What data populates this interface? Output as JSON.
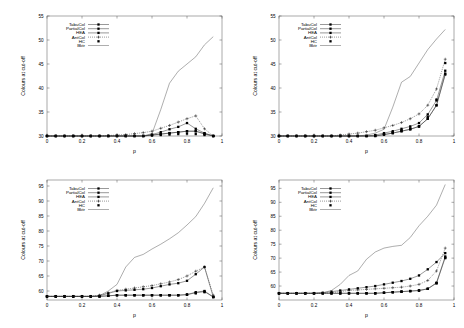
{
  "figure": {
    "layout": "2x2-grid",
    "panel_count": 4,
    "background": "#ffffff",
    "ink": "#000000"
  },
  "legend": {
    "position": "top-left-inside",
    "entries": [
      {
        "label": "TabuCol",
        "marker": "filled-square",
        "line": "solid"
      },
      {
        "label": "PartialCol",
        "marker": "filled-square",
        "line": "solid"
      },
      {
        "label": "HEA",
        "marker": "filled-square",
        "line": "solid"
      },
      {
        "label": "AntCol",
        "marker": "plus",
        "line": "dotted"
      },
      {
        "label": "HC",
        "marker": "filled-square",
        "line": "none"
      },
      {
        "label": "Bktr",
        "marker": "none",
        "line": "solid-thin"
      }
    ]
  },
  "chart_data": [
    {
      "type": "line",
      "panel": "top-left",
      "title": "",
      "xlabel": "p",
      "ylabel": "Colours at cut-off",
      "xlim": [
        0,
        1
      ],
      "ylim": [
        30,
        55
      ],
      "xticks": [
        0,
        0.2,
        0.4,
        0.6,
        0.8,
        1
      ],
      "xticklabels": [
        "0",
        "0.2",
        "0.4",
        "0.6",
        "0.8",
        "1"
      ],
      "yticks": [
        30,
        35,
        40,
        45,
        50,
        55
      ],
      "yticklabels": [
        "30",
        "35",
        "40",
        "45",
        "50",
        "55"
      ],
      "grid": false,
      "x": [
        0,
        0.05,
        0.1,
        0.15,
        0.2,
        0.25,
        0.3,
        0.35,
        0.4,
        0.45,
        0.5,
        0.55,
        0.6,
        0.65,
        0.7,
        0.75,
        0.8,
        0.85,
        0.9,
        0.95
      ],
      "series": [
        {
          "name": "TabuCol",
          "values": [
            30,
            30,
            30,
            30,
            30,
            30,
            30,
            30,
            30,
            30,
            30,
            30,
            30.2,
            30.4,
            30.6,
            30.8,
            31,
            31,
            30.5,
            30
          ]
        },
        {
          "name": "PartialCol",
          "values": [
            30,
            30,
            30,
            30,
            30,
            30,
            30,
            30,
            30,
            30,
            30,
            30,
            30.3,
            30.8,
            31.4,
            31.9,
            32.7,
            31.5,
            30.6,
            30
          ]
        },
        {
          "name": "HEA",
          "values": [
            30,
            30,
            30,
            30,
            30,
            30,
            30,
            30,
            30,
            30,
            30,
            30,
            30.2,
            30.4,
            30.6,
            30.8,
            31,
            31,
            30.4,
            30
          ]
        },
        {
          "name": "AntCol",
          "values": [
            30,
            30,
            30,
            30,
            30,
            30,
            30,
            30.1,
            30.2,
            30.3,
            30.5,
            30.7,
            31,
            31.6,
            32.2,
            32.9,
            33.6,
            34.2,
            31.5,
            30
          ]
        },
        {
          "name": "HC",
          "values": [
            30,
            30,
            30,
            30,
            30,
            30,
            30,
            30,
            30,
            30,
            30,
            30,
            30.1,
            30.2,
            30.3,
            30.4,
            30.5,
            30.4,
            30.2,
            30
          ]
        },
        {
          "name": "Bktr",
          "values": [
            30,
            30,
            30,
            30,
            30,
            30,
            30,
            30,
            30,
            30,
            30,
            30,
            30.5,
            35.5,
            41,
            43.5,
            45,
            46.5,
            49,
            50.7
          ]
        }
      ]
    },
    {
      "type": "line",
      "panel": "top-right",
      "title": "",
      "xlabel": "p",
      "ylabel": "Colours at cut-off",
      "xlim": [
        0,
        1
      ],
      "ylim": [
        30,
        55
      ],
      "xticks": [
        0,
        0.2,
        0.4,
        0.6,
        0.8,
        1
      ],
      "xticklabels": [
        "0",
        "0.2",
        "0.4",
        "0.6",
        "0.8",
        "1"
      ],
      "yticks": [
        30,
        35,
        40,
        45,
        50,
        55
      ],
      "yticklabels": [
        "30",
        "35",
        "40",
        "45",
        "50",
        "55"
      ],
      "grid": false,
      "x": [
        0,
        0.05,
        0.1,
        0.15,
        0.2,
        0.25,
        0.3,
        0.35,
        0.4,
        0.45,
        0.5,
        0.55,
        0.6,
        0.65,
        0.7,
        0.75,
        0.8,
        0.85,
        0.9,
        0.95
      ],
      "series": [
        {
          "name": "TabuCol",
          "values": [
            30,
            30,
            30,
            30,
            30,
            30,
            30,
            30,
            30,
            30,
            30,
            30,
            30.3,
            30.6,
            31,
            31.4,
            32,
            33.6,
            36.4,
            42.8
          ]
        },
        {
          "name": "PartialCol",
          "values": [
            30,
            30,
            30,
            30,
            30,
            30,
            30,
            30,
            30,
            30,
            30,
            30.2,
            30.6,
            31,
            31.5,
            32,
            32.7,
            34.5,
            37.4,
            43.6
          ]
        },
        {
          "name": "HEA",
          "values": [
            30,
            30,
            30,
            30,
            30,
            30,
            30,
            30,
            30,
            30,
            30,
            30,
            30.3,
            30.6,
            31,
            31.4,
            32,
            33.6,
            36.4,
            43
          ]
        },
        {
          "name": "AntCol",
          "values": [
            30,
            30,
            30,
            30,
            30,
            30,
            30,
            30.2,
            30.4,
            30.6,
            30.9,
            31.2,
            31.7,
            32.2,
            32.8,
            33.6,
            34.6,
            36.4,
            39.8,
            46
          ]
        },
        {
          "name": "HC",
          "values": [
            30,
            30,
            30,
            30,
            30,
            30,
            30,
            30,
            30,
            30,
            30,
            30.1,
            30.4,
            30.8,
            31.2,
            31.6,
            32,
            34,
            37.6,
            45.2
          ]
        },
        {
          "name": "Bktr",
          "values": [
            30,
            30,
            30,
            30,
            30,
            30,
            30,
            30,
            30,
            30,
            30.2,
            30.6,
            31.4,
            36,
            41.2,
            42.4,
            45.2,
            48,
            50.2,
            52.2
          ]
        }
      ]
    },
    {
      "type": "line",
      "panel": "bottom-left",
      "title": "",
      "xlabel": "p",
      "ylabel": "Colours at cut-off",
      "xlim": [
        0,
        1
      ],
      "ylim": [
        57,
        97
      ],
      "xticks": [
        0,
        0.2,
        0.4,
        0.6,
        0.8,
        1
      ],
      "xticklabels": [
        "0",
        "0.2",
        "0.4",
        "0.6",
        "0.8",
        "1"
      ],
      "yticks": [
        60,
        65,
        70,
        75,
        80,
        85,
        90,
        95
      ],
      "yticklabels": [
        "60",
        "65",
        "70",
        "75",
        "80",
        "85",
        "90",
        "95"
      ],
      "grid": false,
      "x": [
        0,
        0.05,
        0.1,
        0.15,
        0.2,
        0.25,
        0.3,
        0.35,
        0.4,
        0.45,
        0.5,
        0.55,
        0.6,
        0.65,
        0.7,
        0.75,
        0.8,
        0.85,
        0.9,
        0.95
      ],
      "series": [
        {
          "name": "TabuCol",
          "values": [
            58.2,
            58.2,
            58.2,
            58.2,
            58.2,
            58.2,
            58.2,
            58.4,
            58.6,
            58.6,
            58.6,
            58.6,
            58.6,
            58.6,
            58.6,
            58.6,
            58.8,
            59.6,
            60,
            58
          ]
        },
        {
          "name": "PartialCol",
          "values": [
            58.2,
            58.2,
            58.2,
            58.2,
            58.2,
            58.2,
            58.4,
            59.2,
            60,
            60.2,
            60.4,
            60.6,
            61,
            61.6,
            62.2,
            62.6,
            63.4,
            65.6,
            68,
            58
          ]
        },
        {
          "name": "HEA",
          "values": [
            58.2,
            58.2,
            58.2,
            58.2,
            58.2,
            58.2,
            58.2,
            58.4,
            58.6,
            58.6,
            58.6,
            58.6,
            58.6,
            58.6,
            58.6,
            58.6,
            58.8,
            59.4,
            59.8,
            58
          ]
        },
        {
          "name": "AntCol",
          "values": [
            58.2,
            58.2,
            58.2,
            58.2,
            58.2,
            58.2,
            58.6,
            59.4,
            60.2,
            60.6,
            61,
            61.4,
            61.8,
            62.4,
            63,
            63.8,
            65,
            66.6,
            68,
            58.6
          ]
        },
        {
          "name": "HC",
          "values": [
            58.2,
            58.2,
            58.2,
            58.2,
            58.2,
            58.2,
            58.2,
            58.4,
            58.6,
            58.6,
            58.6,
            58.6,
            58.6,
            58.6,
            58.6,
            58.6,
            58.8,
            59.2,
            59.6,
            58
          ]
        },
        {
          "name": "Bktr",
          "values": [
            58.2,
            58.2,
            58.2,
            58.2,
            58.2,
            58.2,
            58.4,
            60,
            62.2,
            68,
            71.2,
            72.2,
            74,
            75.6,
            77.4,
            79.4,
            82,
            84.8,
            89.2,
            94.4
          ]
        }
      ]
    },
    {
      "type": "line",
      "panel": "bottom-right",
      "title": "",
      "xlabel": "p",
      "ylabel": "Colours at cut-off",
      "xlim": [
        0,
        1
      ],
      "ylim": [
        55,
        98
      ],
      "xticks": [
        0,
        0.2,
        0.4,
        0.6,
        0.8,
        1
      ],
      "xticklabels": [
        "0",
        "0.2",
        "0.4",
        "0.6",
        "0.8",
        "1"
      ],
      "yticks": [
        60,
        65,
        70,
        75,
        80,
        85,
        90,
        95
      ],
      "yticklabels": [
        "60",
        "65",
        "70",
        "75",
        "80",
        "85",
        "90",
        "95"
      ],
      "grid": false,
      "x": [
        0,
        0.05,
        0.1,
        0.15,
        0.2,
        0.25,
        0.3,
        0.35,
        0.4,
        0.45,
        0.5,
        0.55,
        0.6,
        0.65,
        0.7,
        0.75,
        0.8,
        0.85,
        0.9,
        0.95
      ],
      "series": [
        {
          "name": "TabuCol",
          "values": [
            57.4,
            57.4,
            57.4,
            57.4,
            57.4,
            57.4,
            57.4,
            57.4,
            57.4,
            57.4,
            57.4,
            57.4,
            57.6,
            57.8,
            58,
            58.2,
            58.4,
            59,
            61,
            70.2
          ]
        },
        {
          "name": "PartialCol",
          "values": [
            57.4,
            57.4,
            57.4,
            57.4,
            57.4,
            57.6,
            58,
            58.4,
            58.8,
            59.2,
            59.6,
            60,
            60.6,
            61.2,
            61.8,
            62.6,
            63.8,
            66,
            68.6,
            71.8
          ]
        },
        {
          "name": "HEA",
          "values": [
            57.4,
            57.4,
            57.4,
            57.4,
            57.4,
            57.4,
            57.4,
            57.4,
            57.4,
            57.4,
            57.4,
            57.4,
            57.6,
            57.8,
            58,
            58.2,
            58.4,
            59,
            61.2,
            70.6
          ]
        },
        {
          "name": "AntCol",
          "values": [
            57.4,
            57.4,
            57.4,
            57.4,
            57.4,
            57.4,
            57.6,
            58,
            58.4,
            58.6,
            58.8,
            59,
            59.2,
            59.4,
            59.6,
            60,
            60.6,
            62,
            65.4,
            73.6
          ]
        },
        {
          "name": "HC",
          "values": [
            57.4,
            57.4,
            57.4,
            57.4,
            57.4,
            57.4,
            57.4,
            57.4,
            57.4,
            57.4,
            57.4,
            57.4,
            57.6,
            57.8,
            58,
            58.2,
            58.4,
            59,
            61,
            70
          ]
        },
        {
          "name": "Bktr",
          "values": [
            57.4,
            57.4,
            57.4,
            57.4,
            57.4,
            57.6,
            58.4,
            60.6,
            63.8,
            65.4,
            69.6,
            72.2,
            73.6,
            74.2,
            74.6,
            77.4,
            81.6,
            85,
            89,
            96.4
          ]
        }
      ]
    }
  ]
}
